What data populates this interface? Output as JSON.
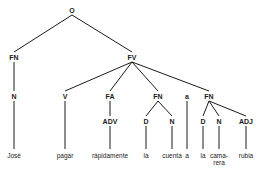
{
  "diagram": {
    "type": "syntax-tree",
    "nodes": [
      {
        "id": "O",
        "label": "O",
        "x": 72,
        "y": 10,
        "kind": "phrase"
      },
      {
        "id": "FN1",
        "label": "FN",
        "x": 14,
        "y": 57,
        "kind": "phrase"
      },
      {
        "id": "FV",
        "label": "FV",
        "x": 132,
        "y": 57,
        "kind": "phrase"
      },
      {
        "id": "N1",
        "label": "N",
        "x": 14,
        "y": 96,
        "kind": "category"
      },
      {
        "id": "V",
        "label": "V",
        "x": 65,
        "y": 96,
        "kind": "category"
      },
      {
        "id": "FA",
        "label": "FA",
        "x": 110,
        "y": 96,
        "kind": "phrase"
      },
      {
        "id": "FN2",
        "label": "FN",
        "x": 158,
        "y": 96,
        "kind": "phrase"
      },
      {
        "id": "A",
        "label": "a",
        "x": 187,
        "y": 96,
        "kind": "word"
      },
      {
        "id": "FN3",
        "label": "FN",
        "x": 209,
        "y": 96,
        "kind": "phrase"
      },
      {
        "id": "ADV",
        "label": "ADV",
        "x": 110,
        "y": 121,
        "kind": "category"
      },
      {
        "id": "D1",
        "label": "D",
        "x": 146,
        "y": 121,
        "kind": "category"
      },
      {
        "id": "N2",
        "label": "N",
        "x": 172,
        "y": 121,
        "kind": "category"
      },
      {
        "id": "D2",
        "label": "D",
        "x": 203,
        "y": 121,
        "kind": "category"
      },
      {
        "id": "N3",
        "label": "N",
        "x": 219,
        "y": 121,
        "kind": "category"
      },
      {
        "id": "ADJ",
        "label": "ADJ",
        "x": 246,
        "y": 121,
        "kind": "category"
      }
    ],
    "leaves": [
      {
        "id": "w1",
        "parent": "N1",
        "text": "José",
        "x": 14,
        "y": 156
      },
      {
        "id": "w2",
        "parent": "V",
        "text": "pagar",
        "x": 65,
        "y": 156
      },
      {
        "id": "w3",
        "parent": "ADV",
        "text": "rápidamente",
        "x": 110,
        "y": 156
      },
      {
        "id": "w4",
        "parent": "D1",
        "text": "la",
        "x": 146,
        "y": 156
      },
      {
        "id": "w5",
        "parent": "N2",
        "text": "cuenta",
        "x": 172,
        "y": 156
      },
      {
        "id": "w6",
        "parent": "A",
        "text": "a",
        "x": 187,
        "y": 156
      },
      {
        "id": "w7",
        "parent": "D2",
        "text": "la",
        "x": 203,
        "y": 156
      },
      {
        "id": "w8",
        "parent": "N3",
        "text": "cama-",
        "text2": "rera",
        "x": 219,
        "y": 156
      },
      {
        "id": "w9",
        "parent": "ADJ",
        "text": "rubia",
        "x": 246,
        "y": 156
      }
    ],
    "edges": [
      [
        "O",
        "FN1"
      ],
      [
        "O",
        "FV"
      ],
      [
        "FN1",
        "N1"
      ],
      [
        "FV",
        "V"
      ],
      [
        "FV",
        "FA"
      ],
      [
        "FV",
        "FN2"
      ],
      [
        "FV",
        "FN3"
      ],
      [
        "FA",
        "ADV"
      ],
      [
        "FN2",
        "D1"
      ],
      [
        "FN2",
        "N2"
      ],
      [
        "FN3",
        "D2"
      ],
      [
        "FN3",
        "N3"
      ],
      [
        "FN3",
        "ADJ"
      ]
    ],
    "line_color": "#1a1a1a"
  }
}
